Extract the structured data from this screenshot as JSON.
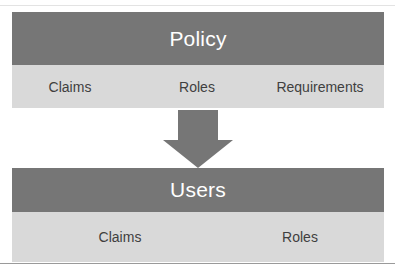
{
  "diagram": {
    "type": "flow-diagram",
    "colors": {
      "band_dark": "#767676",
      "band_light": "#d9d9d9",
      "arrow": "#767676",
      "title_text": "#ffffff",
      "item_text": "#3f3f3f",
      "background": "#ffffff"
    },
    "nodes": [
      {
        "id": "policy",
        "title": "Policy",
        "items": [
          "Claims",
          "Roles",
          "Requirements"
        ]
      },
      {
        "id": "users",
        "title": "Users",
        "items": [
          "Claims",
          "Roles"
        ]
      }
    ],
    "connector": {
      "kind": "down-arrow",
      "from": "policy",
      "to": "users"
    }
  }
}
